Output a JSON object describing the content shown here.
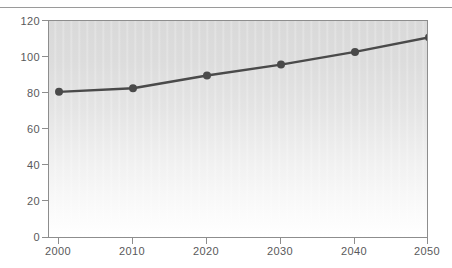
{
  "chart_data": {
    "type": "line",
    "title": "",
    "subtitle": "",
    "xlabel": "",
    "ylabel": "",
    "x": [
      2000,
      2010,
      2020,
      2030,
      2040,
      2050
    ],
    "categories": [
      "2000",
      "2010",
      "2020",
      "2030",
      "2040",
      "2050"
    ],
    "values": [
      81,
      83,
      90,
      96,
      103,
      111
    ],
    "series": [
      {
        "name": "",
        "values": [
          81,
          83,
          90,
          96,
          103,
          111
        ]
      }
    ],
    "xlim": [
      2000,
      2050
    ],
    "ylim": [
      0,
      120
    ],
    "ytick_labels": [
      "0",
      "20",
      "40",
      "60",
      "80",
      "100",
      "120"
    ],
    "ytick_values": [
      0,
      20,
      40,
      60,
      80,
      100,
      120
    ],
    "xtick_labels": [
      "2000",
      "2010",
      "2020",
      "2030",
      "2040",
      "2050"
    ],
    "grid": false,
    "legend": null,
    "legend_position": "none",
    "marker": "circle",
    "annotations": []
  },
  "style": {
    "line_color": "#4a4a4a",
    "marker_color": "#4a4a4a",
    "axis_color": "#8d8d8d",
    "tick_label_color": "#59595b",
    "plot_bg_top": "#d9d9d9",
    "plot_bg_bottom": "#ffffff",
    "page_bg": "#ffffff",
    "rule_color": "#9a9a9a"
  }
}
